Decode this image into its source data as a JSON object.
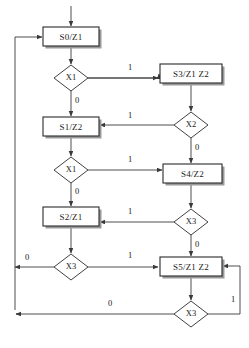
{
  "diagram": {
    "kind": "asm-state-flowchart",
    "title": "",
    "colors": {
      "background": "#ffffff",
      "stroke": "#2b2b2b",
      "line": "#3a3a3a",
      "shadow": "#9a9a9a",
      "text": "#1a1a1a"
    },
    "states": [
      {
        "id": "s0",
        "label": "S0/Z1",
        "x": 43,
        "y": 27,
        "w": 56,
        "h": 19
      },
      {
        "id": "s3",
        "label": "S3/Z1 Z2",
        "x": 160,
        "y": 64,
        "w": 62,
        "h": 19
      },
      {
        "id": "s1",
        "label": "S1/Z2",
        "x": 43,
        "y": 117,
        "w": 56,
        "h": 19
      },
      {
        "id": "s4",
        "label": "S4/Z2",
        "x": 163,
        "y": 164,
        "w": 59,
        "h": 19
      },
      {
        "id": "s2",
        "label": "S2/Z1",
        "x": 43,
        "y": 207,
        "w": 56,
        "h": 19
      },
      {
        "id": "s5",
        "label": "S5/Z1 Z2",
        "x": 160,
        "y": 257,
        "w": 62,
        "h": 19
      }
    ],
    "decisions": [
      {
        "id": "d1",
        "label": "X1",
        "cx": 71,
        "cy": 78,
        "rx": 17,
        "ry": 13
      },
      {
        "id": "d2",
        "label": "X2",
        "cx": 191,
        "cy": 125,
        "rx": 17,
        "ry": 13
      },
      {
        "id": "d3",
        "label": "X1",
        "cx": 71,
        "cy": 170,
        "rx": 17,
        "ry": 13
      },
      {
        "id": "d4",
        "label": "X3",
        "cx": 191,
        "cy": 222,
        "rx": 17,
        "ry": 13
      },
      {
        "id": "d5",
        "label": "X3",
        "cx": 71,
        "cy": 267,
        "rx": 17,
        "ry": 13
      },
      {
        "id": "d6",
        "label": "X3",
        "cx": 191,
        "cy": 314,
        "rx": 17,
        "ry": 13
      }
    ],
    "edge_labels": [
      {
        "id": "e-x1a-1",
        "text": "1",
        "x": 130,
        "y": 68
      },
      {
        "id": "e-x1a-0",
        "text": "0",
        "x": 77,
        "y": 101
      },
      {
        "id": "e-x2-1",
        "text": "1",
        "x": 130,
        "y": 116
      },
      {
        "id": "e-x2-0",
        "text": "0",
        "x": 197,
        "y": 148
      },
      {
        "id": "e-x1b-1",
        "text": "1",
        "x": 130,
        "y": 160
      },
      {
        "id": "e-x1b-0",
        "text": "0",
        "x": 77,
        "y": 192
      },
      {
        "id": "e-x3a-1",
        "text": "1",
        "x": 130,
        "y": 212
      },
      {
        "id": "e-x3a-0",
        "text": "0",
        "x": 197,
        "y": 245
      },
      {
        "id": "e-x3b-0",
        "text": "0",
        "x": 27,
        "y": 258
      },
      {
        "id": "e-x3b-1",
        "text": "1",
        "x": 130,
        "y": 256
      },
      {
        "id": "e-x3c-0",
        "text": "0",
        "x": 110,
        "y": 304
      },
      {
        "id": "e-x3c-1",
        "text": "1",
        "x": 233,
        "y": 300
      }
    ],
    "entry_arrow": {
      "id": "entry",
      "x": 71,
      "y_from": 6,
      "y_to": 27
    },
    "transitions": [
      {
        "from": "entry",
        "to": "s0",
        "condition": ""
      },
      {
        "from": "s0",
        "to": "d1",
        "condition": ""
      },
      {
        "from": "d1",
        "to": "s3",
        "condition": "1"
      },
      {
        "from": "d1",
        "to": "s1",
        "condition": "0"
      },
      {
        "from": "s3",
        "to": "d2",
        "condition": ""
      },
      {
        "from": "d2",
        "to": "s1",
        "condition": "1"
      },
      {
        "from": "d2",
        "to": "s4",
        "condition": "0"
      },
      {
        "from": "s1",
        "to": "d3",
        "condition": ""
      },
      {
        "from": "d3",
        "to": "s4",
        "condition": "1"
      },
      {
        "from": "d3",
        "to": "s2",
        "condition": "0"
      },
      {
        "from": "s4",
        "to": "d4",
        "condition": ""
      },
      {
        "from": "d4",
        "to": "s2",
        "condition": "1"
      },
      {
        "from": "d4",
        "to": "s5",
        "condition": "0"
      },
      {
        "from": "s2",
        "to": "d5",
        "condition": ""
      },
      {
        "from": "d5",
        "to": "s5",
        "condition": "1"
      },
      {
        "from": "d5",
        "to": "s0",
        "condition": "0"
      },
      {
        "from": "s5",
        "to": "d6",
        "condition": ""
      },
      {
        "from": "d6",
        "to": "s0",
        "condition": "0"
      },
      {
        "from": "d6",
        "to": "s5",
        "condition": "1"
      }
    ]
  }
}
